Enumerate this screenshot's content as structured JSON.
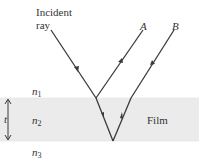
{
  "labels": {
    "incident_line1": "Incident",
    "incident_line2": "ray",
    "ray_a": "A",
    "ray_b": "B",
    "film": "Film",
    "thickness": "t",
    "n1": "n",
    "n1_sub": "1",
    "n2": "n",
    "n2_sub": "2",
    "n3": "n",
    "n3_sub": "3"
  },
  "colors": {
    "film_fill": "#ebebeb",
    "ray_stroke": "#3a3a3a",
    "text": "#333333"
  }
}
